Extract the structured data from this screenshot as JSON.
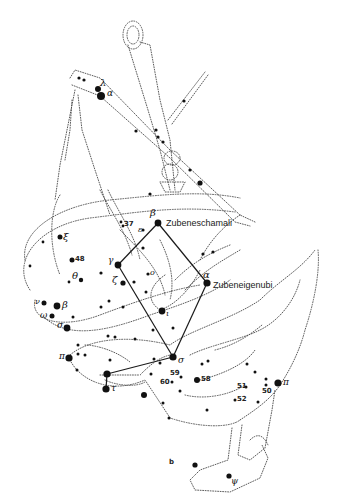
{
  "figure": {
    "panel_label": "b",
    "named_stars": {
      "beta": "Zubeneschamali",
      "alpha": "Zubeneigenubi"
    },
    "greek_labels": {
      "lambda": "λ",
      "alpha_top": "α",
      "beta": "β",
      "epsilon": "ε",
      "xi": "ξ",
      "gamma": "γ",
      "theta": "θ",
      "zeta": "ζ",
      "omicron": "o",
      "alpha": "α",
      "nu": "ν",
      "beta_left": "β",
      "omega": "ω",
      "sigma_left": "σ",
      "iota": "ι",
      "pi_left": "π",
      "sigma": "σ",
      "tau": "τ",
      "pi_right": "π",
      "psi": "ψ"
    },
    "numbered_labels": {
      "n37": "37",
      "n48": "48",
      "n59": "59",
      "n60": "60",
      "n58": "58",
      "n51": "51",
      "n50": "50",
      "n52": "52"
    }
  },
  "colors": {
    "background": "#ffffff",
    "ink": "#111111",
    "outline": "#4a4a4a"
  }
}
